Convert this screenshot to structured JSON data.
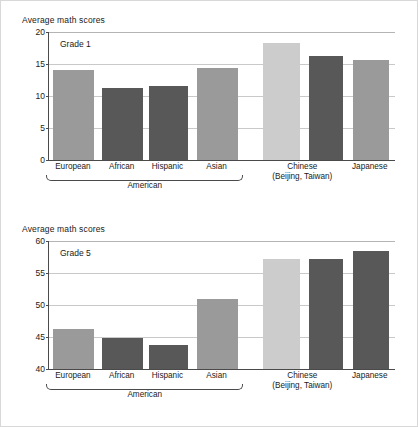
{
  "figure": {
    "background": "#ffffff",
    "border_color": "#d8d8d8"
  },
  "palette": {
    "light_gray": "#cccccc",
    "medium_gray": "#9a9a9a",
    "dark_gray": "#585858",
    "axis": "#4a4a4a",
    "grid": "#c9c9c9"
  },
  "panels": [
    {
      "id": "grade1",
      "axis_title": "Average math scores",
      "panel_label": "Grade 1",
      "yticks": [
        "0",
        "5",
        "10",
        "15",
        "20"
      ],
      "group_bracket_label": "American",
      "xlabels": [
        {
          "line1": "European",
          "line2": ""
        },
        {
          "line1": "African",
          "line2": ""
        },
        {
          "line1": "Hispanic",
          "line2": ""
        },
        {
          "line1": "Asian",
          "line2": ""
        },
        {
          "line1": "Chinese",
          "line2": "(Beijing, Taiwan)"
        },
        {
          "line1": "Japanese",
          "line2": ""
        }
      ]
    },
    {
      "id": "grade5",
      "axis_title": "Average math scores",
      "panel_label": "Grade 5",
      "yticks": [
        "40",
        "45",
        "50",
        "55",
        "60"
      ],
      "group_bracket_label": "American",
      "xlabels": [
        {
          "line1": "European",
          "line2": ""
        },
        {
          "line1": "African",
          "line2": ""
        },
        {
          "line1": "Hispanic",
          "line2": ""
        },
        {
          "line1": "Asian",
          "line2": ""
        },
        {
          "line1": "Chinese",
          "line2": "(Beijing, Taiwan)"
        },
        {
          "line1": "Japanese",
          "line2": ""
        }
      ]
    }
  ],
  "chart_data": [
    {
      "type": "bar",
      "title": "Grade 1",
      "ylabel": "Average math scores",
      "xlabel": "",
      "ylim": [
        0,
        20
      ],
      "yticks": [
        0,
        5,
        10,
        15,
        20
      ],
      "grid": true,
      "legend": "none",
      "categories": [
        "European American",
        "African American",
        "Hispanic American",
        "Asian American",
        "Chinese (Beijing, Taiwan)",
        "Japanese"
      ],
      "values": [
        14.1,
        11.3,
        11.5,
        14.4,
        18.3,
        15.6
      ],
      "bar_colors": [
        "#9a9a9a",
        "#585858",
        "#585858",
        "#9a9a9a",
        "#cccccc",
        "#9a9a9a"
      ]
    },
    {
      "type": "bar",
      "title": "Grade 5",
      "ylabel": "Average math scores",
      "xlabel": "",
      "ylim": [
        40,
        60
      ],
      "yticks": [
        40,
        45,
        50,
        55,
        60
      ],
      "grid": true,
      "legend": "none",
      "categories": [
        "European American",
        "African American",
        "Hispanic American",
        "Asian American",
        "Chinese (Beijing, Taiwan)",
        "Japanese"
      ],
      "values": [
        46.2,
        44.9,
        43.7,
        51.0,
        57.2,
        58.5
      ],
      "bar_colors": [
        "#9a9a9a",
        "#585858",
        "#585858",
        "#9a9a9a",
        "#cccccc",
        "#585858"
      ]
    }
  ],
  "chart_extra": {
    "grade1_japanese_second_value": 16.3,
    "grade5_japanese_value": 57.2
  }
}
